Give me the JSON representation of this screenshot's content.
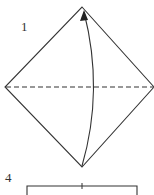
{
  "diagram": {
    "type": "origami-fold-instructions",
    "steps": [
      {
        "label": "1",
        "shape": "square-diamond",
        "fold_line": "dashed-horizontal",
        "arrow": "fold-bottom-to-top"
      },
      {
        "label": "4",
        "shape": "partial-rectangle"
      }
    ],
    "colors": {
      "line": "#333333",
      "background": "#ffffff"
    }
  }
}
